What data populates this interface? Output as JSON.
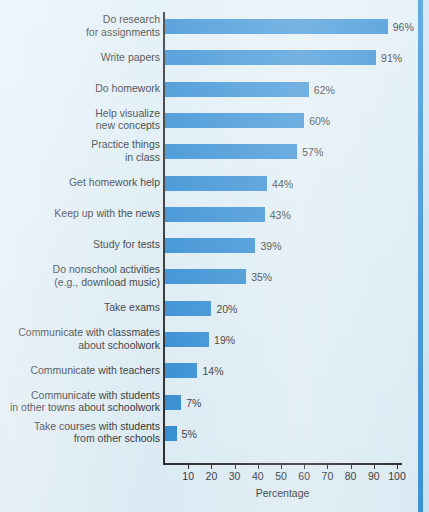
{
  "chart_data": {
    "type": "bar",
    "orientation": "horizontal",
    "title": "",
    "xlabel": "Percentage",
    "ylabel": "",
    "xlim": [
      0,
      110
    ],
    "grid": false,
    "legend": null,
    "bar_color": "#2e8bd4",
    "background_color": "#dfeef7",
    "axis_color": "#262626",
    "xticks": [
      10,
      20,
      30,
      40,
      50,
      60,
      70,
      80,
      90,
      100
    ],
    "xtick_labels": [
      "10",
      "20",
      "30",
      "40",
      "50",
      "60",
      "70",
      "80",
      "90",
      "100"
    ],
    "categories": [
      "Do research\nfor assignments",
      "Write papers",
      "Do homework",
      "Help visualize\nnew concepts",
      "Practice things\nin class",
      "Get homework help",
      "Keep up with the news",
      "Study for tests",
      "Do nonschool activities\n(e.g., download music)",
      "Take exams",
      "Communicate with classmates\nabout schoolwork",
      "Communicate with teachers",
      "Communicate with students\nin other towns about schoolwork",
      "Take courses with students\nfrom other schools"
    ],
    "values": [
      96,
      91,
      62,
      60,
      57,
      44,
      43,
      39,
      35,
      20,
      19,
      14,
      7,
      5
    ],
    "value_labels": [
      "96%",
      "91%",
      "62%",
      "60%",
      "57%",
      "44%",
      "43%",
      "39%",
      "35%",
      "20%",
      "19%",
      "14%",
      "7%",
      "5%"
    ]
  },
  "axis": {
    "x_title": "Percentage"
  }
}
